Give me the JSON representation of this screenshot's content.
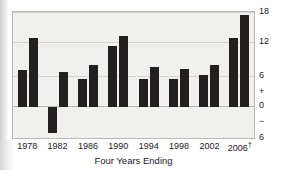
{
  "top_caption": "",
  "chart_data": {
    "type": "bar",
    "title": "",
    "xlabel": "Four Years Ending",
    "ylabel": "",
    "categories": [
      "1978",
      "1982",
      "1986",
      "1990",
      "1994",
      "1998",
      "2002",
      "2006†"
    ],
    "series": [
      {
        "name": "left",
        "values": [
          7.0,
          -5.0,
          5.3,
          11.5,
          5.2,
          5.2,
          6.0,
          13.0
        ]
      },
      {
        "name": "right",
        "values": [
          13.0,
          6.5,
          8.0,
          13.5,
          7.5,
          7.2,
          8.0,
          17.5
        ]
      }
    ],
    "ylim": [
      -6,
      18
    ],
    "yticks": [
      "18",
      "12",
      "6",
      "0",
      "6"
    ],
    "ytick_values": [
      18,
      12,
      6,
      0,
      -6
    ],
    "sign_markers": [
      "+",
      "−"
    ],
    "gridlines": [
      18,
      12,
      6,
      0
    ],
    "zero_line": 0,
    "grid": true,
    "legend": "none",
    "axis_position": "right",
    "bar_color": "#231f20",
    "plot_background": "#f0f0ee",
    "grid_color": "#d3d3cf",
    "footnote_marker": "†"
  }
}
